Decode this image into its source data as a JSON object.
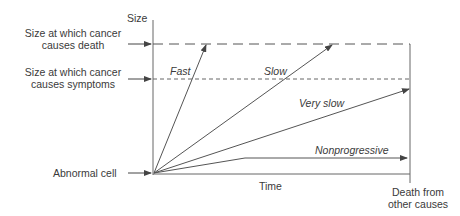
{
  "diagram": {
    "y_axis_label": "Size",
    "x_axis_label": "Time",
    "levels": {
      "death": {
        "line1": "Size at which cancer",
        "line2": "causes death"
      },
      "symptoms": {
        "line1": "Size at which cancer",
        "line2": "causes symptoms"
      }
    },
    "origin_label": "Abnormal cell",
    "end_label": {
      "line1": "Death from",
      "line2": "other causes"
    },
    "trajectories": [
      {
        "name": "Fast",
        "label": "Fast"
      },
      {
        "name": "Slow",
        "label": "Slow"
      },
      {
        "name": "Very slow",
        "label": "Very slow"
      },
      {
        "name": "Nonprogressive",
        "label": "Nonprogressive"
      }
    ],
    "colors": {
      "line": "#555555",
      "text": "#3a3a3a"
    }
  }
}
